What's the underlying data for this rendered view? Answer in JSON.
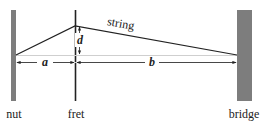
{
  "diagram": {
    "labels": {
      "nut": "nut",
      "fret": "fret",
      "bridge": "bridge",
      "string": "string",
      "a": "a",
      "b": "b",
      "d": "d"
    },
    "colors": {
      "post_fill": "#7d7d7d",
      "line": "#222222",
      "guide": "#cfcfcf"
    }
  }
}
